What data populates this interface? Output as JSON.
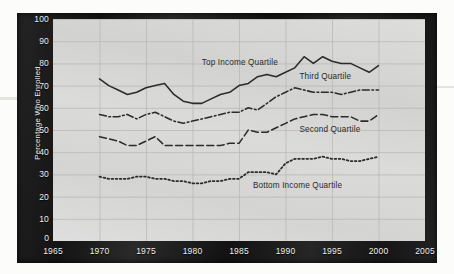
{
  "chart_data": {
    "type": "line",
    "title": "",
    "subtitle": "",
    "xlabel": "",
    "ylabel": "Percentage Who Enrolled",
    "xlim": [
      1965,
      2005
    ],
    "ylim": [
      0,
      100
    ],
    "grid": true,
    "legend_position": "inline-annotations",
    "x_ticks": [
      "1965",
      "1970",
      "1975",
      "1980",
      "1985",
      "1990",
      "1995",
      "2000",
      "2005"
    ],
    "y_ticks": [
      "0",
      "10",
      "20",
      "30",
      "40",
      "50",
      "60",
      "70",
      "80",
      "90",
      "100"
    ],
    "x": [
      1970,
      1971,
      1972,
      1973,
      1974,
      1975,
      1976,
      1977,
      1978,
      1979,
      1980,
      1981,
      1982,
      1983,
      1984,
      1985,
      1986,
      1987,
      1988,
      1989,
      1990,
      1991,
      1992,
      1993,
      1994,
      1995,
      1996,
      1997,
      1998,
      1999,
      2000
    ],
    "series": [
      {
        "name": "Top Income Quartile",
        "style": "solid",
        "color": "#2b2b2b",
        "values": [
          73,
          70,
          68,
          66,
          67,
          69,
          70,
          71,
          66,
          63,
          62,
          62,
          64,
          66,
          67,
          70,
          71,
          74,
          75,
          74,
          76,
          78,
          83,
          80,
          83,
          81,
          80,
          80,
          78,
          76,
          79
        ]
      },
      {
        "name": "Third Quartile",
        "style": "dash-dot",
        "color": "#2b2b2b",
        "values": [
          57,
          56,
          56,
          57,
          55,
          57,
          58,
          56,
          54,
          53,
          54,
          55,
          56,
          57,
          58,
          58,
          60,
          59,
          62,
          65,
          67,
          69,
          68,
          67,
          67,
          67,
          66,
          67,
          68,
          68,
          68
        ]
      },
      {
        "name": "Second Quartile",
        "style": "dash",
        "color": "#2b2b2b",
        "values": [
          47,
          46,
          45,
          43,
          43,
          45,
          47,
          43,
          43,
          43,
          43,
          43,
          43,
          43,
          44,
          44,
          50,
          49,
          49,
          51,
          53,
          55,
          56,
          57,
          57,
          56,
          56,
          56,
          54,
          54,
          57
        ]
      },
      {
        "name": "Bottom Income Quartile",
        "style": "dotted",
        "color": "#2b2b2b",
        "values": [
          29,
          28,
          28,
          28,
          29,
          29,
          28,
          28,
          27,
          27,
          26,
          26,
          27,
          27,
          28,
          28,
          31,
          31,
          31,
          30,
          35,
          37,
          37,
          37,
          38,
          37,
          37,
          36,
          36,
          37,
          38
        ]
      }
    ],
    "annotations": [
      {
        "text": "Top Income Quartile",
        "x": 1981.0,
        "y": 80.0
      },
      {
        "text": "Third Quartile",
        "x": 1991.5,
        "y": 74.0
      },
      {
        "text": "Second Quartile",
        "x": 1991.5,
        "y": 50.0
      },
      {
        "text": "Bottom Income Quartile",
        "x": 1986.5,
        "y": 25.0
      }
    ]
  }
}
